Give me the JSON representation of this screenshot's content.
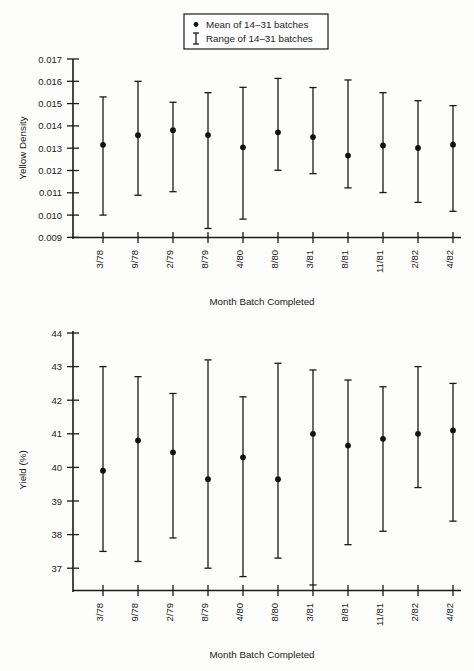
{
  "legend": {
    "mean_label": "Mean of 14–31 batches",
    "range_label": "Range of 14–31 batches",
    "position": "top-center"
  },
  "chart_data": [
    {
      "type": "scatter",
      "name": "yellow-density-chart",
      "title": "",
      "xlabel": "Month Batch Completed",
      "ylabel": "Yellow Density",
      "categories": [
        "3/78",
        "9/78",
        "2/79",
        "8/79",
        "4/80",
        "8/80",
        "3/81",
        "8/81",
        "11/81",
        "2/82",
        "4/82"
      ],
      "ylim": [
        0.009,
        0.017
      ],
      "yticks": [
        "0.009",
        "0.010",
        "0.011",
        "0.012",
        "0.013",
        "0.014",
        "0.015",
        "0.016",
        "0.017"
      ],
      "ytick_values": [
        0.009,
        0.01,
        0.011,
        0.012,
        0.013,
        0.014,
        0.015,
        0.016,
        0.017
      ],
      "grid": false,
      "series": [
        {
          "name": "Mean of 14-31 batches",
          "values": [
            0.01315,
            0.01358,
            0.01381,
            0.01359,
            0.01304,
            0.01371,
            0.0135,
            0.01267,
            0.01312,
            0.01301,
            0.01316
          ]
        }
      ],
      "range_low": [
        0.01,
        0.01089,
        0.01105,
        0.0094,
        0.00982,
        0.01201,
        0.01186,
        0.01122,
        0.01101,
        0.01057,
        0.01017
      ],
      "range_high": [
        0.0153,
        0.016,
        0.01506,
        0.01549,
        0.01573,
        0.01613,
        0.01572,
        0.01606,
        0.01549,
        0.01513,
        0.01491
      ]
    },
    {
      "type": "scatter",
      "name": "yield-chart",
      "title": "",
      "xlabel": "Month Batch Completed",
      "ylabel": "Yield (%)",
      "categories": [
        "3/78",
        "9/78",
        "2/79",
        "8/79",
        "4/80",
        "8/80",
        "3/81",
        "8/81",
        "11/81",
        "2/82",
        "4/82"
      ],
      "ylim": [
        36.4,
        44.2
      ],
      "yticks": [
        "37",
        "38",
        "39",
        "40",
        "41",
        "42",
        "43",
        "44"
      ],
      "ytick_values": [
        37,
        38,
        39,
        40,
        41,
        42,
        43,
        44
      ],
      "grid": false,
      "series": [
        {
          "name": "Mean of 14-31 batches",
          "values": [
            39.9,
            40.8,
            40.45,
            39.65,
            40.3,
            39.65,
            41.0,
            40.65,
            40.85,
            41.0,
            41.1
          ]
        }
      ],
      "range_low": [
        37.5,
        37.2,
        37.9,
        37.0,
        36.75,
        37.3,
        36.5,
        37.7,
        38.1,
        39.4,
        38.4
      ],
      "range_high": [
        43.0,
        42.7,
        42.2,
        43.2,
        42.1,
        43.1,
        42.9,
        42.6,
        42.4,
        43.0,
        42.5
      ]
    }
  ],
  "charts": {
    "top": {
      "ylabel": "Yellow Density",
      "xlabel": "Month Batch Completed"
    },
    "bottom": {
      "ylabel": "Yield (%)",
      "xlabel": "Month Batch Completed"
    }
  }
}
